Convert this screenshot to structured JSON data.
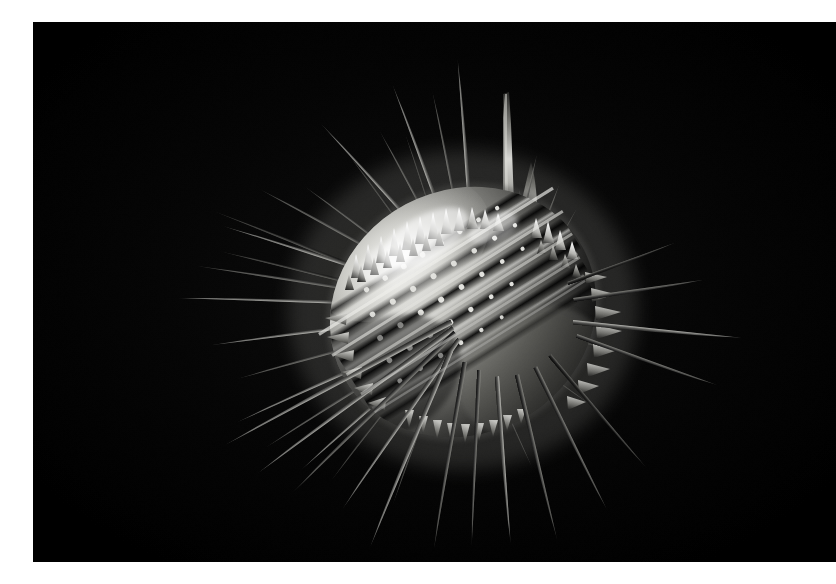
{
  "page": {
    "width": 836,
    "height": 584,
    "background_color": "#ffffff",
    "margin_left_px": 33,
    "margin_top_px": 22,
    "margin_bottom_px": 22,
    "margin_right_px": 0
  },
  "plate": {
    "name": "sem-micrograph-plate",
    "background_color": "#000000",
    "left": 33,
    "top": 22,
    "width": 803,
    "height": 540,
    "alt_text": "Scanning electron micrograph of a spiny spherical microfossil with long radiating needle-like spines, photographed against a black background"
  },
  "subject": {
    "label": "spiny-microorganism-test",
    "description": "Globular calcareous test bearing dense short conical tubercles and numerous long tapering radiating spines",
    "body_center_x": 430,
    "body_center_y": 290,
    "body_radius_x": 135,
    "body_radius_y": 120,
    "rotation_deg": -28,
    "highlight_color": "#f6f6f4",
    "midtone_color": "#9a9a96",
    "shadow_color": "#1a1a1a",
    "spine_color": "#c8c8c4",
    "bounds": {
      "left": 144,
      "top": 68,
      "right": 690,
      "bottom": 512
    }
  },
  "spines": {
    "count_long": 26,
    "count_short": 52,
    "long_spines": [
      {
        "angle": -96,
        "length": 215,
        "width": 11,
        "bright": 0.86
      },
      {
        "angle": -103,
        "length": 185,
        "width": 8,
        "bright": 0.74
      },
      {
        "angle": -112,
        "length": 205,
        "width": 10,
        "bright": 0.8
      },
      {
        "angle": -120,
        "length": 175,
        "width": 8,
        "bright": 0.7
      },
      {
        "angle": -131,
        "length": 215,
        "width": 9,
        "bright": 0.76
      },
      {
        "angle": -142,
        "length": 185,
        "width": 8,
        "bright": 0.66
      },
      {
        "angle": -152,
        "length": 230,
        "width": 9,
        "bright": 0.72
      },
      {
        "angle": -161,
        "length": 250,
        "width": 9,
        "bright": 0.7
      },
      {
        "angle": -170,
        "length": 265,
        "width": 8,
        "bright": 0.66
      },
      {
        "angle": -178,
        "length": 280,
        "width": 9,
        "bright": 0.68
      },
      {
        "angle": 172,
        "length": 250,
        "width": 8,
        "bright": 0.62
      },
      {
        "angle": 163,
        "length": 225,
        "width": 8,
        "bright": 0.6
      },
      {
        "angle": 154,
        "length": 245,
        "width": 9,
        "bright": 0.64
      },
      {
        "angle": 145,
        "length": 230,
        "width": 9,
        "bright": 0.62
      },
      {
        "angle": 135,
        "length": 215,
        "width": 8,
        "bright": 0.58
      },
      {
        "angle": 124,
        "length": 190,
        "width": 8,
        "bright": 0.55
      },
      {
        "angle": 113,
        "length": 205,
        "width": 9,
        "bright": 0.58
      },
      {
        "angle": 103,
        "length": 215,
        "width": 9,
        "bright": 0.6
      },
      {
        "angle": 94,
        "length": 225,
        "width": 10,
        "bright": 0.62
      },
      {
        "angle": 84,
        "length": 200,
        "width": 9,
        "bright": 0.58
      },
      {
        "angle": 73,
        "length": 185,
        "width": 9,
        "bright": 0.55
      },
      {
        "angle": 60,
        "length": 165,
        "width": 8,
        "bright": 0.5
      },
      {
        "angle": 46,
        "length": 150,
        "width": 8,
        "bright": 0.46
      },
      {
        "angle": 22,
        "length": 175,
        "width": 9,
        "bright": 0.52
      },
      {
        "angle": 6,
        "length": 195,
        "width": 10,
        "bright": 0.58
      },
      {
        "angle": -12,
        "length": 140,
        "width": 8,
        "bright": 0.48
      }
    ]
  },
  "tonal_range": {
    "black_level": "#000000",
    "deep_shadow": "#0b0b0b",
    "mid_grey": "#7c7c79",
    "light_grey": "#c4c4c0",
    "specular_white": "#ffffff"
  },
  "annotations": {
    "scale_bar_visible": false,
    "caption_visible": false,
    "text_overlays": []
  }
}
